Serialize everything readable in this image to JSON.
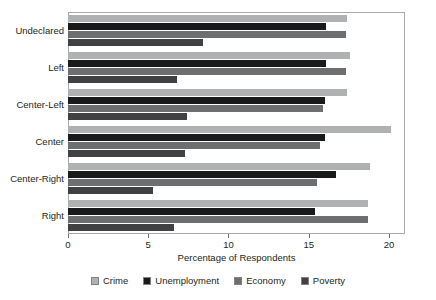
{
  "chart_data": {
    "type": "bar",
    "orientation": "horizontal",
    "title": "",
    "xlabel": "Percentage of Respondents",
    "ylabel": "",
    "xlim": [
      0,
      21
    ],
    "xticks": [
      0,
      5,
      10,
      15,
      20
    ],
    "xtick_labels": [
      "0",
      "5",
      "10",
      "15",
      "20"
    ],
    "grid": false,
    "legend_position": "bottom",
    "categories": [
      "Undeclared",
      "Left",
      "Center-Left",
      "Center",
      "Center-Right",
      "Right"
    ],
    "series": [
      {
        "name": "Crime",
        "color": "#b0b1b3",
        "values": [
          17.4,
          17.6,
          17.4,
          20.1,
          18.8,
          18.7
        ]
      },
      {
        "name": "Unemployment",
        "color": "#1a1a1a",
        "values": [
          16.1,
          16.1,
          16.0,
          16.0,
          16.7,
          15.4
        ]
      },
      {
        "name": "Economy",
        "color": "#6d6e70",
        "values": [
          17.3,
          17.3,
          15.9,
          15.7,
          15.5,
          18.7
        ]
      },
      {
        "name": "Poverty",
        "color": "#414042",
        "values": [
          8.4,
          6.8,
          7.4,
          7.3,
          5.3,
          6.6
        ]
      }
    ]
  },
  "legend": {
    "items": [
      {
        "label": "Crime",
        "color": "#b0b1b3"
      },
      {
        "label": "Unemployment",
        "color": "#1a1a1a"
      },
      {
        "label": "Economy",
        "color": "#6d6e70"
      },
      {
        "label": "Poverty",
        "color": "#414042"
      }
    ]
  },
  "axis": {
    "x_title": "Percentage of Respondents"
  }
}
